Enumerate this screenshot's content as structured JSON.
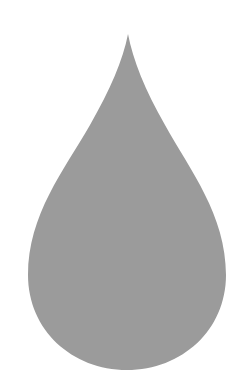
{
  "image": {
    "subject": "water droplet",
    "background_color": "#ffffff",
    "fill_color": "#9b9b9b"
  }
}
